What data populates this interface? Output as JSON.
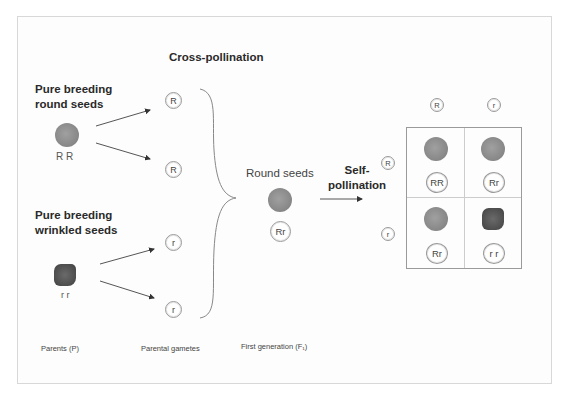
{
  "title": "Cross-pollination",
  "parents": {
    "round_label": [
      "Pure breeding",
      "round seeds"
    ],
    "round_genotype": "R R",
    "wrinkled_label": [
      "Pure breeding",
      "wrinkled seeds"
    ],
    "wrinkled_genotype": "r r"
  },
  "gametes": [
    "R",
    "R",
    "r",
    "r"
  ],
  "f1": {
    "label": "Round seeds",
    "genotype": "Rr"
  },
  "self_pollination": [
    "Self-",
    "pollination"
  ],
  "punnett": {
    "col_headers": [
      "R",
      "r"
    ],
    "row_headers": [
      "R",
      "r"
    ],
    "cells": [
      {
        "genotype": "RR",
        "phenotype": "round"
      },
      {
        "genotype": "Rr",
        "phenotype": "round"
      },
      {
        "genotype": "Rr",
        "phenotype": "round"
      },
      {
        "genotype": "r r",
        "phenotype": "wrinkled"
      }
    ]
  },
  "bottom_labels": {
    "parents": "Parents (P)",
    "gametes": "Parental gametes",
    "first_gen": "First generation (F₁)"
  }
}
